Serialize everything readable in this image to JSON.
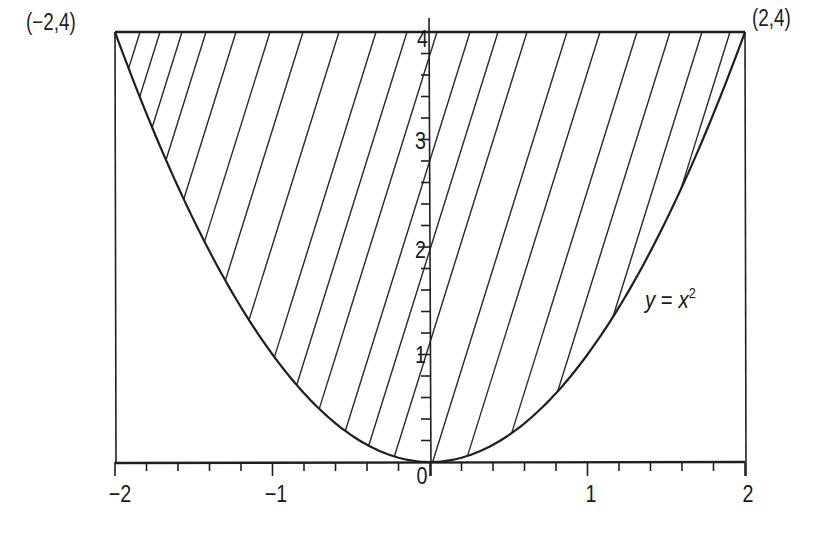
{
  "chart_data": {
    "type": "area",
    "title": "",
    "xlabel": "",
    "ylabel": "",
    "xlim": [
      -2,
      2
    ],
    "ylim": [
      0,
      4
    ],
    "grid": false,
    "legend": null,
    "x_ticks": [
      -2,
      -1,
      0,
      1,
      2
    ],
    "x_tick_labels": [
      "−2",
      "−1",
      "0",
      "1",
      "2"
    ],
    "x_minor_step": 0.2,
    "y_ticks": [
      1,
      2,
      3,
      4
    ],
    "y_tick_labels": [
      "1",
      "2",
      "3",
      "4"
    ],
    "y_minor_step": 0.2,
    "series": [
      {
        "name": "y = x^2",
        "kind": "curve",
        "x": [
          -2,
          -1.5,
          -1,
          -0.5,
          0,
          0.5,
          1,
          1.5,
          2
        ],
        "y": [
          4,
          2.25,
          1,
          0.25,
          0,
          0.25,
          1,
          2.25,
          4
        ]
      },
      {
        "name": "y = 4",
        "kind": "line",
        "x": [
          -2,
          2
        ],
        "y": [
          4,
          4
        ]
      }
    ],
    "region": {
      "lower": "y = x^2",
      "upper": "y = 4",
      "x_range": [
        -2,
        2
      ],
      "fill": "diagonal-hatch"
    },
    "annotations": [
      {
        "text": "(−2,4)",
        "x": -2,
        "y": 4,
        "position": "left"
      },
      {
        "text": "(2,4)",
        "x": 2,
        "y": 4,
        "position": "right"
      },
      {
        "text": "y = x²",
        "x": 1.35,
        "y": 1.7,
        "position": "right-of-curve"
      }
    ]
  },
  "labels": {
    "left_point": "(−2,4)",
    "right_point": "(2,4)",
    "curve_y": "y",
    "curve_eq": " = ",
    "curve_x": "x",
    "curve_exp": "2",
    "x_ticks": [
      "−2",
      "−1",
      "0",
      "1",
      "2"
    ],
    "y_ticks": [
      "1",
      "2",
      "3",
      "4"
    ]
  },
  "colors": {
    "line": "#1f1f1f",
    "background": "#ffffff"
  }
}
